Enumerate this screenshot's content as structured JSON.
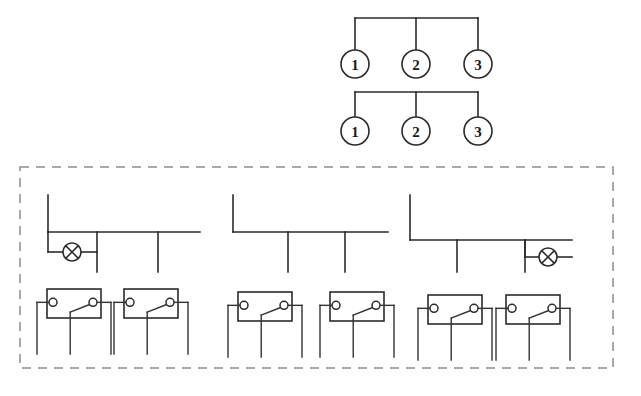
{
  "diagram": {
    "canvas": {
      "width": 641,
      "height": 396,
      "background": "#ffffff"
    },
    "colors": {
      "wire": "#2b2b2b",
      "enclosure_dashed": "#8d8d8d",
      "fill": "#ffffff",
      "label_text": "#1a1a1a"
    }
  },
  "top_section": {
    "name": "numbered-terminal-groups",
    "groups": [
      {
        "id": "group-upper",
        "bus": {
          "y": 18,
          "x_start": 355,
          "x_end": 478
        },
        "nodes": [
          {
            "label": "1",
            "cx": 355,
            "cy": 64,
            "r": 14
          },
          {
            "label": "2",
            "cx": 416,
            "cy": 64,
            "r": 14
          },
          {
            "label": "3",
            "cx": 478,
            "cy": 64,
            "r": 14
          }
        ]
      },
      {
        "id": "group-lower",
        "bus": {
          "y": 92,
          "x_start": 355,
          "x_end": 478
        },
        "nodes": [
          {
            "label": "1",
            "cx": 355,
            "cy": 131,
            "r": 14
          },
          {
            "label": "2",
            "cx": 416,
            "cy": 131,
            "r": 14
          },
          {
            "label": "3",
            "cx": 478,
            "cy": 131,
            "r": 14
          }
        ]
      }
    ]
  },
  "enclosure": {
    "name": "dashed-enclosure",
    "x": 20,
    "y": 167,
    "width": 593,
    "height": 201,
    "style": "dashed"
  },
  "feeder_section": {
    "name": "three-feeder-branches",
    "branches": [
      {
        "id": "feeder-left",
        "riser": {
          "x": 48,
          "y_top": 195,
          "y_bottom": 232
        },
        "bus": {
          "y": 232,
          "x_start": 48,
          "x_end": 200
        },
        "drops": [
          {
            "x": 97,
            "y_top": 232,
            "y_bottom": 272
          },
          {
            "x": 158,
            "y_top": 232,
            "y_bottom": 272
          }
        ],
        "lamp": {
          "cx": 72,
          "cy": 252,
          "r": 9,
          "lead_y": 252,
          "lead_x_start": 48,
          "lead_x_end": 97
        },
        "has_lamp": true
      },
      {
        "id": "feeder-middle",
        "riser": {
          "x": 233,
          "y_top": 195,
          "y_bottom": 232
        },
        "bus": {
          "y": 232,
          "x_start": 233,
          "x_end": 388
        },
        "drops": [
          {
            "x": 288,
            "y_top": 232,
            "y_bottom": 272
          },
          {
            "x": 345,
            "y_top": 232,
            "y_bottom": 272
          }
        ],
        "has_lamp": false
      },
      {
        "id": "feeder-right",
        "riser": {
          "x": 410,
          "y_top": 195,
          "y_bottom": 240
        },
        "bus": {
          "y": 240,
          "x_start": 410,
          "x_end": 572
        },
        "drops": [
          {
            "x": 457,
            "y_top": 240,
            "y_bottom": 272
          },
          {
            "x": 525,
            "y_top": 240,
            "y_bottom": 272
          }
        ],
        "lamp": {
          "cx": 548,
          "cy": 257,
          "r": 9,
          "lead_y": 257,
          "lead_x_start": 525,
          "lead_x_end": 572
        },
        "has_lamp": true
      }
    ]
  },
  "relay_section": {
    "name": "relay-contact-row",
    "count": 6,
    "relays": [
      {
        "id": "relay-1",
        "box_x": 47,
        "box_y": 289,
        "box_w": 54,
        "box_h": 29
      },
      {
        "id": "relay-2",
        "box_x": 124,
        "box_y": 289,
        "box_w": 54,
        "box_h": 29
      },
      {
        "id": "relay-3",
        "box_x": 238,
        "box_y": 292,
        "box_w": 54,
        "box_h": 29
      },
      {
        "id": "relay-4",
        "box_x": 330,
        "box_y": 292,
        "box_w": 54,
        "box_h": 29
      },
      {
        "id": "relay-5",
        "box_x": 428,
        "box_y": 295,
        "box_w": 54,
        "box_h": 29
      },
      {
        "id": "relay-6",
        "box_x": 506,
        "box_y": 295,
        "box_w": 54,
        "box_h": 29
      }
    ],
    "geometry": {
      "terminal_radius": 4,
      "lead_drop_length": 36,
      "description": "changeover contact: common terminal left, normally-open terminal right, blade drawn from lower-centre to right terminal"
    }
  },
  "legend": {
    "symbols": [
      {
        "name": "lamp-symbol",
        "meaning": "signal lamp (crossed circle)"
      },
      {
        "name": "relay-contact-symbol",
        "meaning": "changeover switch contact"
      },
      {
        "name": "numbered-terminal",
        "meaning": "terminal number"
      }
    ]
  }
}
